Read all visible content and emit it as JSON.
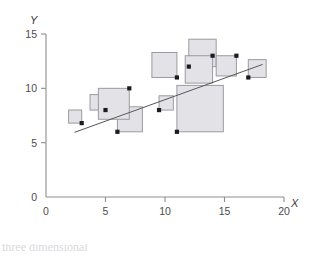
{
  "chart_data": {
    "type": "scatter",
    "title": "",
    "xlabel": "X",
    "ylabel": "Y",
    "xlim": [
      0,
      20
    ],
    "ylim": [
      0,
      15
    ],
    "xticks": [
      0,
      5,
      10,
      15,
      20
    ],
    "yticks": [
      0,
      5,
      10,
      15
    ],
    "xtick_labels": [
      "0",
      "5",
      "10",
      "15",
      "20"
    ],
    "ytick_labels": [
      "0",
      "5",
      "10",
      "15"
    ],
    "grid": false,
    "legend": "none",
    "marker_style": "square-bubble-anchored-at-point",
    "points": [
      {
        "x": 3,
        "y": 6.8,
        "size": 1.1,
        "anchor": "bottom-right"
      },
      {
        "x": 5,
        "y": 8,
        "size": 1.3,
        "anchor": "bottom-right"
      },
      {
        "x": 6,
        "y": 6,
        "size": 2.1,
        "anchor": "bottom-left"
      },
      {
        "x": 7,
        "y": 10,
        "size": 2.6,
        "anchor": "top-right"
      },
      {
        "x": 9.5,
        "y": 8,
        "size": 1.2,
        "anchor": "bottom-left"
      },
      {
        "x": 11,
        "y": 11,
        "size": 2.1,
        "anchor": "bottom-right"
      },
      {
        "x": 11,
        "y": 6,
        "size": 3.9,
        "anchor": "bottom-left"
      },
      {
        "x": 12,
        "y": 12,
        "size": 2.3,
        "anchor": "bottom-left"
      },
      {
        "x": 14,
        "y": 13,
        "size": 2.3,
        "anchor": "top-right"
      },
      {
        "x": 16,
        "y": 13,
        "size": 1.7,
        "anchor": "top-right"
      },
      {
        "x": 17,
        "y": 11,
        "size": 1.5,
        "anchor": "bottom-left"
      }
    ],
    "trendline": {
      "label": "",
      "x_start": 2.4,
      "y_start": 5.95,
      "x_end": 18.2,
      "y_end": 12.2
    },
    "annotations": []
  },
  "caption": {
    "text": "three dimensional"
  }
}
